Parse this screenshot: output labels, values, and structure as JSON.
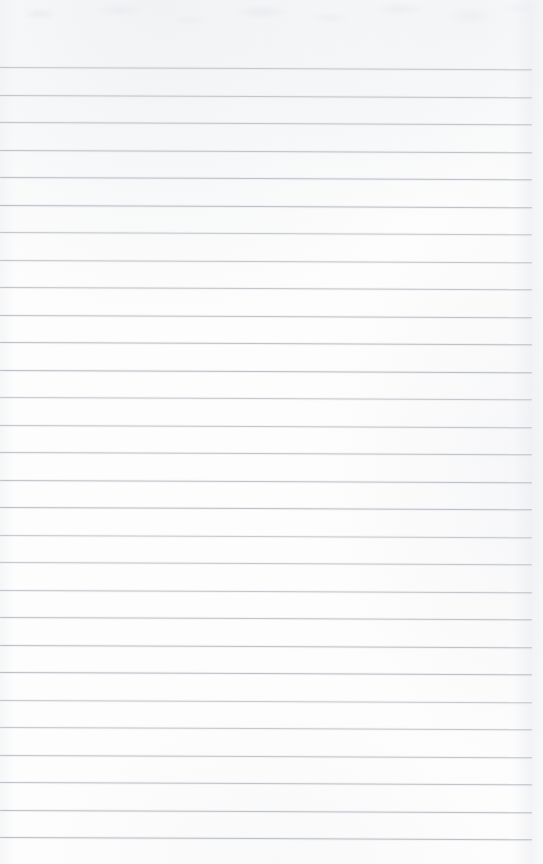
{
  "document": {
    "kind": "scanned-ruled-notebook-page",
    "title": "Blank Lined Notebook Page",
    "content_text": "",
    "is_blank": true,
    "width_px": 543,
    "height_px": 864
  },
  "page": {
    "background_color": "#fdfdfd",
    "paper_tint": "#f1f2f5",
    "edge_shadow_color": "#eaecef"
  },
  "ruling": {
    "line_color": "#b9bdc5",
    "line_thickness_px": 1,
    "line_spacing_px": 27.5,
    "first_line_y_px": 67,
    "last_line_y_px": 837,
    "line_start_x_px": 0,
    "line_end_x_px": 532,
    "skew_degrees": 0.25,
    "line_count": 29,
    "line_positions_y": [
      67,
      94.5,
      122,
      149.5,
      177,
      204.5,
      232,
      259.5,
      287,
      314.5,
      342,
      369.5,
      397,
      424.5,
      452,
      479.5,
      507,
      534.5,
      562,
      589.5,
      617,
      644.5,
      672,
      699.5,
      727,
      754.5,
      782,
      809.5,
      837
    ]
  },
  "margins": {
    "top_px": 67,
    "bottom_px": 27,
    "left_px": 0,
    "right_px": 11,
    "has_vertical_margin_rule": false
  }
}
